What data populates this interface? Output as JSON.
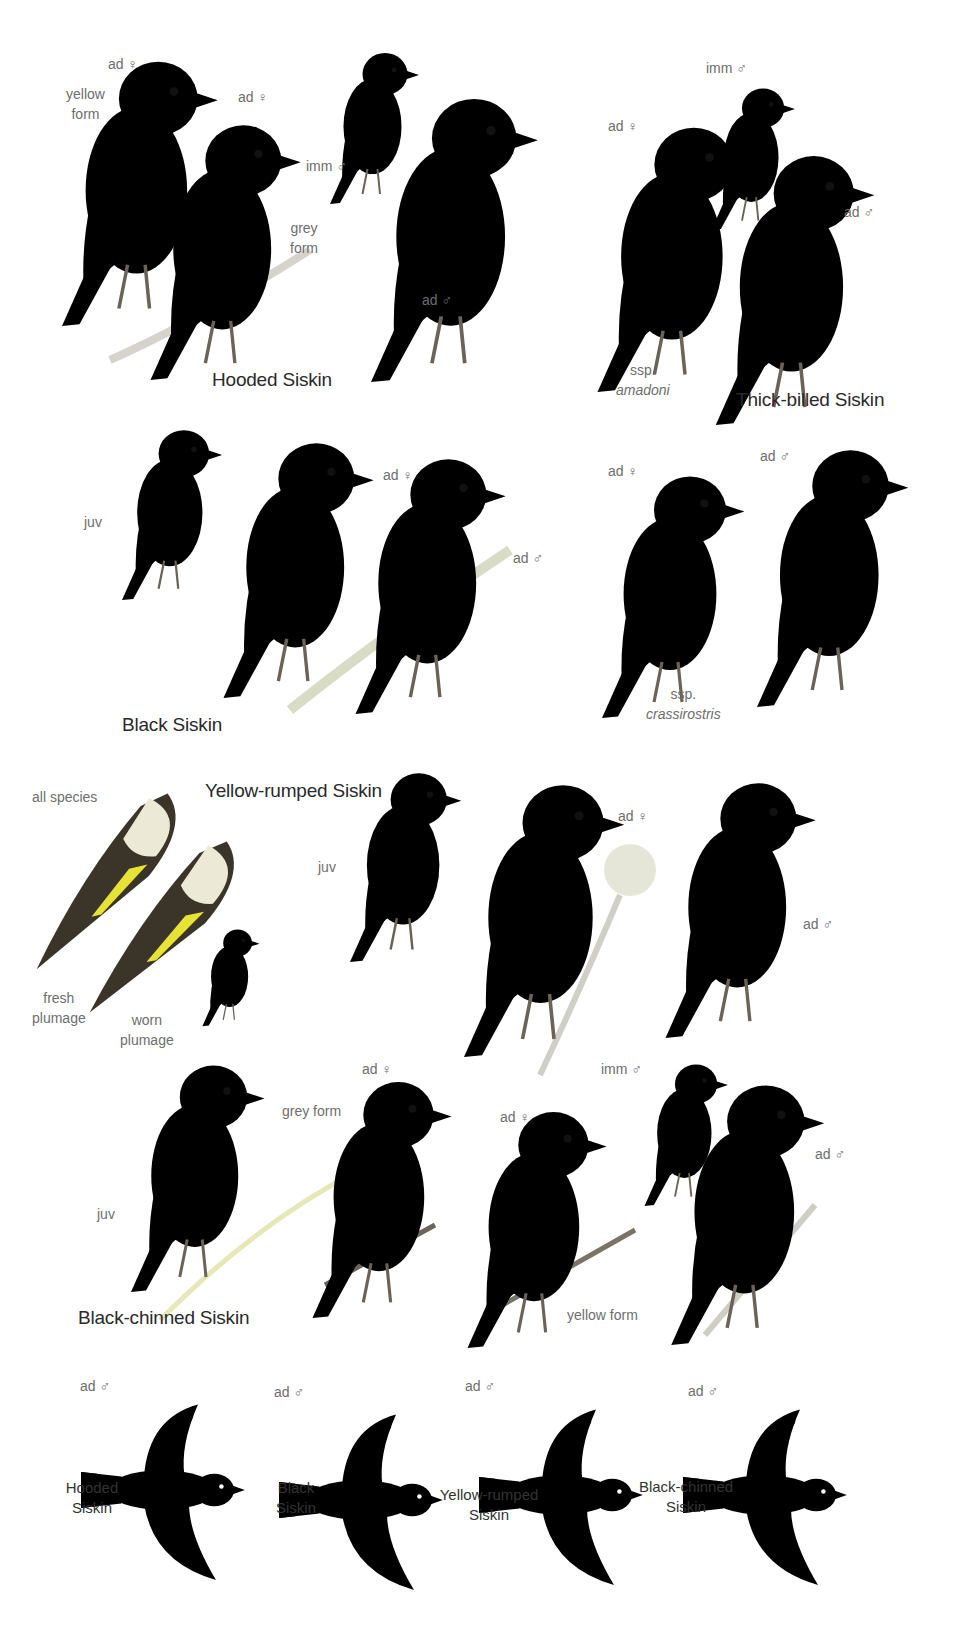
{
  "plate": {
    "background": "#ffffff",
    "colors": {
      "yellow": "#f2e62a",
      "pale_yellow": "#e6e78a",
      "olive": "#a9a85a",
      "grey": "#c9c9c5",
      "black_hood": "#2b241d",
      "dark_wing": "#3a3429",
      "bill": "#9a9a96",
      "label_grey": "#6e6e6e",
      "title_dark": "#2a2a2a"
    },
    "sections": [
      {
        "title": "Hooded Siskin",
        "labels": [
          {
            "text": "ad ♀"
          },
          {
            "line1": "yellow",
            "line2": "form"
          },
          {
            "text": "ad ♀"
          },
          {
            "line1": "grey",
            "line2": "form"
          },
          {
            "text": "imm ♂"
          },
          {
            "text": "ad ♂"
          }
        ]
      },
      {
        "title": "Thick-billed Siskin",
        "labels": [
          {
            "text": "imm ♂"
          },
          {
            "text": "ad ♀"
          },
          {
            "text": "ad ♂"
          },
          {
            "line1": "ssp.",
            "line2": "amadoni"
          }
        ]
      },
      {
        "title": "Black Siskin",
        "labels": [
          {
            "text": "juv"
          },
          {
            "text": "ad ♀"
          },
          {
            "text": "ad ♂"
          }
        ]
      },
      {
        "title": "",
        "labels": [
          {
            "text": "ad ♀"
          },
          {
            "text": "ad ♂"
          },
          {
            "line1": "ssp.",
            "line2": "crassirostris"
          }
        ]
      },
      {
        "title": "Yellow-rumped Siskin",
        "labels": [
          {
            "text": "all species"
          },
          {
            "line1": "fresh",
            "line2": "plumage"
          },
          {
            "line1": "worn",
            "line2": "plumage"
          },
          {
            "text": "juv"
          },
          {
            "text": "ad ♀"
          },
          {
            "text": "ad ♂"
          }
        ]
      },
      {
        "title": "Black-chinned Siskin",
        "labels": [
          {
            "text": "juv"
          },
          {
            "text": "grey form"
          },
          {
            "text": "ad ♀"
          },
          {
            "text": "ad ♀"
          },
          {
            "text": "imm ♂"
          },
          {
            "text": "ad ♂"
          },
          {
            "text": "yellow form"
          }
        ]
      }
    ],
    "flight": [
      {
        "age": "ad ♂",
        "line1": "Hooded",
        "line2": "Siskin"
      },
      {
        "age": "ad ♂",
        "line1": "Black",
        "line2": "Siskin"
      },
      {
        "age": "ad ♂",
        "line1": "Yellow-rumped",
        "line2": "Siskin"
      },
      {
        "age": "ad ♂",
        "line1": "Black-chinned",
        "line2": "Siskin"
      }
    ]
  }
}
